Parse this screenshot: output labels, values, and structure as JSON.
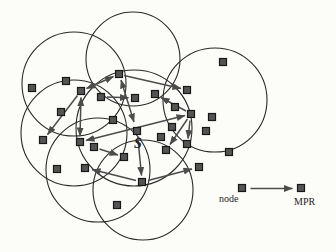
{
  "figure": {
    "background": "#fcfcf9",
    "circle_color": "#2a2a2a",
    "arrow_color": "#4c4c4c",
    "node_fill": "#545454",
    "node_border": "#181818",
    "node_size": 7,
    "center_label": "S",
    "circles": [
      {
        "cx": 74,
        "cy": 84,
        "r": 52
      },
      {
        "cx": 133,
        "cy": 59,
        "r": 47
      },
      {
        "cx": 215,
        "cy": 100,
        "r": 52
      },
      {
        "cx": 74,
        "cy": 133,
        "r": 53
      },
      {
        "cx": 134,
        "cy": 128,
        "r": 58
      },
      {
        "cx": 98,
        "cy": 170,
        "r": 52
      },
      {
        "cx": 143,
        "cy": 190,
        "r": 50
      }
    ],
    "nodes": [
      [
        32,
        88
      ],
      [
        66,
        81
      ],
      [
        119,
        74
      ],
      [
        81,
        91
      ],
      [
        101,
        97
      ],
      [
        135,
        98
      ],
      [
        155,
        94
      ],
      [
        187,
        90
      ],
      [
        223,
        62
      ],
      [
        61,
        112
      ],
      [
        113,
        120
      ],
      [
        175,
        107
      ],
      [
        191,
        114
      ],
      [
        212,
        117
      ],
      [
        137,
        131
      ],
      [
        172,
        127
      ],
      [
        161,
        137
      ],
      [
        187,
        144
      ],
      [
        166,
        150
      ],
      [
        206,
        131
      ],
      [
        229,
        152
      ],
      [
        199,
        167
      ],
      [
        80,
        142
      ],
      [
        94,
        147
      ],
      [
        124,
        157
      ],
      [
        85,
        168
      ],
      [
        142,
        182
      ],
      [
        43,
        140
      ],
      [
        57,
        169
      ],
      [
        117,
        205
      ]
    ],
    "arrows": [
      {
        "x1": 113.5,
        "y1": 76.5,
        "x2": 86.5,
        "y2": 88.5,
        "double": true
      },
      {
        "x1": 124,
        "y1": 75.5,
        "x2": 181,
        "y2": 88.5,
        "double": false
      },
      {
        "x1": 121,
        "y1": 80,
        "x2": 134,
        "y2": 122,
        "double": true
      },
      {
        "x1": 107,
        "y1": 97,
        "x2": 128.5,
        "y2": 97.8,
        "double": false
      },
      {
        "x1": 86,
        "y1": 140.5,
        "x2": 185,
        "y2": 115.5,
        "double": true
      },
      {
        "x1": 77.5,
        "y1": 95.5,
        "x2": 47.5,
        "y2": 134.5,
        "double": false
      },
      {
        "x1": 81,
        "y1": 97.5,
        "x2": 80,
        "y2": 136,
        "double": true
      },
      {
        "x1": 137.8,
        "y1": 137,
        "x2": 141.5,
        "y2": 175.5,
        "double": false
      },
      {
        "x1": 99.5,
        "y1": 149,
        "x2": 118,
        "y2": 155,
        "double": false
      },
      {
        "x1": 186,
        "y1": 111,
        "x2": 161,
        "y2": 97.5,
        "double": false
      },
      {
        "x1": 187.5,
        "y1": 119,
        "x2": 170,
        "y2": 144.5,
        "double": false
      },
      {
        "x1": 190,
        "y1": 120.5,
        "x2": 188,
        "y2": 138.5,
        "double": false
      },
      {
        "x1": 136,
        "y1": 180.5,
        "x2": 92,
        "y2": 169.5,
        "double": false
      },
      {
        "x1": 148,
        "y1": 180.5,
        "x2": 192,
        "y2": 169,
        "double": false
      }
    ],
    "legend": {
      "node_label": "node",
      "mpr_label": "MPR",
      "node_square": [
        242,
        188
      ],
      "mpr_square": [
        301,
        188
      ],
      "arrow": {
        "x1": 250.5,
        "y1": 188.5,
        "x2": 292.5,
        "y2": 188.5
      }
    },
    "labels": {
      "s_pos": [
        134,
        137
      ],
      "node_label_pos": [
        219,
        194
      ],
      "mpr_label_pos": [
        294,
        197
      ]
    }
  }
}
